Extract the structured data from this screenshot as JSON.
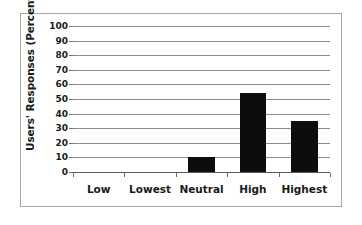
{
  "chart_data": {
    "type": "bar",
    "title": "",
    "subtitle": "",
    "xlabel": "",
    "ylabel": "Users' Responses (Percentage)",
    "categories": [
      "Low",
      "Lowest",
      "Neutral",
      "High",
      "Highest"
    ],
    "values": [
      0,
      0,
      10,
      54,
      35
    ],
    "ylim": [
      0,
      100
    ],
    "ytick_labels": [
      "100",
      "90",
      "80",
      "70",
      "60",
      "50",
      "40",
      "30",
      "20",
      "10",
      "0"
    ],
    "ytick_values": [
      100,
      90,
      80,
      70,
      60,
      50,
      40,
      30,
      20,
      10,
      0
    ],
    "grid": true,
    "grid_axis": "y",
    "legend": null,
    "legend_position": "none",
    "bar_color": "#0d0d0d",
    "gridline_color": "#8c8c8c",
    "axis_color": "#6e6e6e",
    "frame_color": "#a8a8a8",
    "background": "#ffffff"
  },
  "figure": {
    "border_label": "chart-outer-frame"
  }
}
